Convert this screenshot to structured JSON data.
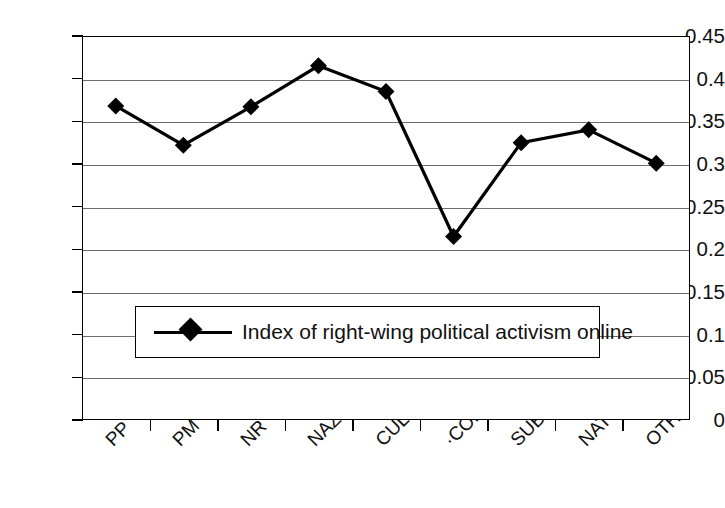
{
  "chart_data": {
    "type": "line",
    "title": "",
    "xlabel": "",
    "ylabel": "",
    "ylim": [
      0,
      0.45
    ],
    "grid": true,
    "legend_position": "inside-lower-left",
    "categories": [
      "PP",
      "PM",
      "NR",
      "NAZI",
      "CUL",
      "·COMM",
      "SUB",
      "NAT",
      "OTH"
    ],
    "series": [
      {
        "name": "Index of right-wing political activism online",
        "marker": "diamond",
        "color": "#000000",
        "values": [
          0.368,
          0.322,
          0.367,
          0.415,
          0.385,
          0.215,
          0.325,
          0.34,
          0.301
        ]
      }
    ],
    "y_ticks": [
      "0",
      "0.05",
      "0.1",
      "0.15",
      "0.2",
      "0.25",
      "0.3",
      "0.35",
      "0.4",
      "0.45"
    ],
    "y_tick_values": [
      0,
      0.05,
      0.1,
      0.15,
      0.2,
      0.25,
      0.3,
      0.35,
      0.4,
      0.45
    ]
  },
  "legend": {
    "entries": [
      {
        "label": "Index of right-wing political activism online"
      }
    ]
  },
  "colors": {
    "series": "#000000",
    "gridline": "#6e6e6e",
    "frame": "#000000",
    "background": "#ffffff",
    "text": "#111111"
  }
}
